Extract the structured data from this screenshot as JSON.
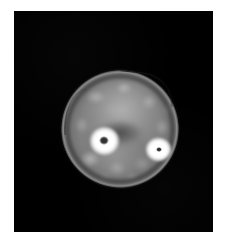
{
  "figure": {
    "type": "medical-cross-sectional-scan",
    "modality": "CT",
    "alt_text": "Axial cross-sectional scan of a limb showing two bones within soft tissue on a black background",
    "background_color": "#ffffff",
    "canvas_color": "#000000"
  },
  "canvas": {
    "x": 14,
    "y": 11,
    "width": 199,
    "height": 221
  },
  "anatomy": {
    "limb_cross_section": {
      "label": "limb-cross-section",
      "center_x": 120,
      "center_y": 128,
      "width": 118,
      "height": 118,
      "soft_tissue_color": "#8a8a8a",
      "skin_rim_color": "#cdcdcd"
    },
    "structures": [
      {
        "name": "bone-left",
        "label": "Left bone (cortical ring with marrow cavity)",
        "center_x": 90,
        "center_y": 129,
        "diameter": 31,
        "cortex_color": "#ffffff",
        "marrow_color": "#2a2a2a",
        "marrow_diameter": 10
      },
      {
        "name": "bone-right",
        "label": "Right bone (smaller, triangular cortical ring)",
        "center_x": 146,
        "center_y": 139,
        "diameter": 26,
        "cortex_color": "#ffffff",
        "marrow_color": "#3a3a3a",
        "marrow_diameter": 6
      },
      {
        "name": "septum",
        "label": "Intermuscular septum (dark central wedge)",
        "center_x": 106,
        "center_y": 132,
        "color": "#484848"
      },
      {
        "name": "fascia-line",
        "label": "Thin dark fascial line along superior-lateral margin",
        "color": "#191919"
      }
    ],
    "mottling": [
      {
        "x": 22,
        "y": 18,
        "w": 26,
        "h": 18,
        "c": "rgba(188,188,188,0.75)"
      },
      {
        "x": 52,
        "y": 10,
        "w": 22,
        "h": 16,
        "c": "rgba(196,196,196,0.70)"
      },
      {
        "x": 78,
        "y": 22,
        "w": 20,
        "h": 20,
        "c": "rgba(185,185,185,0.70)"
      },
      {
        "x": 40,
        "y": 30,
        "w": 28,
        "h": 20,
        "c": "rgba(172,172,172,0.60)"
      },
      {
        "x": 12,
        "y": 44,
        "w": 18,
        "h": 22,
        "c": "rgba(178,178,178,0.65)"
      },
      {
        "x": 92,
        "y": 46,
        "w": 18,
        "h": 22,
        "c": "rgba(182,182,182,0.60)"
      },
      {
        "x": 16,
        "y": 78,
        "w": 26,
        "h": 22,
        "c": "rgba(196,196,196,0.80)"
      },
      {
        "x": 44,
        "y": 88,
        "w": 24,
        "h": 20,
        "c": "rgba(176,176,176,0.70)"
      },
      {
        "x": 70,
        "y": 84,
        "w": 22,
        "h": 20,
        "c": "rgba(168,168,168,0.60)"
      },
      {
        "x": 30,
        "y": 66,
        "w": 16,
        "h": 16,
        "c": "rgba(200,200,200,0.55)"
      },
      {
        "x": 86,
        "y": 64,
        "w": 16,
        "h": 18,
        "c": "rgba(160,160,160,0.55)"
      },
      {
        "x": 58,
        "y": 56,
        "w": 18,
        "h": 14,
        "c": "rgba(150,150,150,0.45)"
      },
      {
        "x": 6,
        "y": 58,
        "w": 14,
        "h": 18,
        "c": "rgba(120,120,120,0.50)"
      },
      {
        "x": 100,
        "y": 30,
        "w": 14,
        "h": 18,
        "c": "rgba(150,150,150,0.45)"
      },
      {
        "x": 34,
        "y": 100,
        "w": 20,
        "h": 14,
        "c": "rgba(146,146,146,0.50)"
      },
      {
        "x": 62,
        "y": 100,
        "w": 18,
        "h": 14,
        "c": "rgba(158,158,158,0.50)"
      }
    ]
  }
}
